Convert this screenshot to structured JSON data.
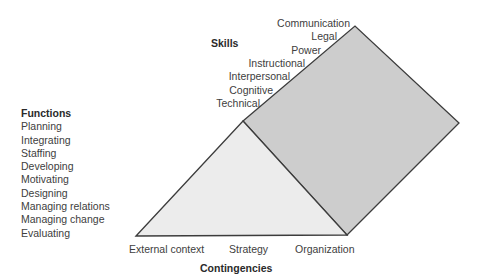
{
  "functions": {
    "title": "Functions",
    "items": [
      "Planning",
      "Integrating",
      "Staffing",
      "Developing",
      "Motivating",
      "Designing",
      "Managing relations",
      "Managing change",
      "Evaluating"
    ]
  },
  "skills": {
    "title": "Skills",
    "items": [
      "Communication",
      "Legal",
      "Power",
      "Instructional",
      "Interpersonal",
      "Cognitive",
      "Technical"
    ]
  },
  "contingencies": {
    "title": "Contingencies",
    "items": [
      "External context",
      "Strategy",
      "Organization"
    ]
  },
  "colors": {
    "triangle_fill": "#ececec",
    "parallelogram_fill": "#cdcdcd",
    "stroke": "#3c3c3c"
  }
}
